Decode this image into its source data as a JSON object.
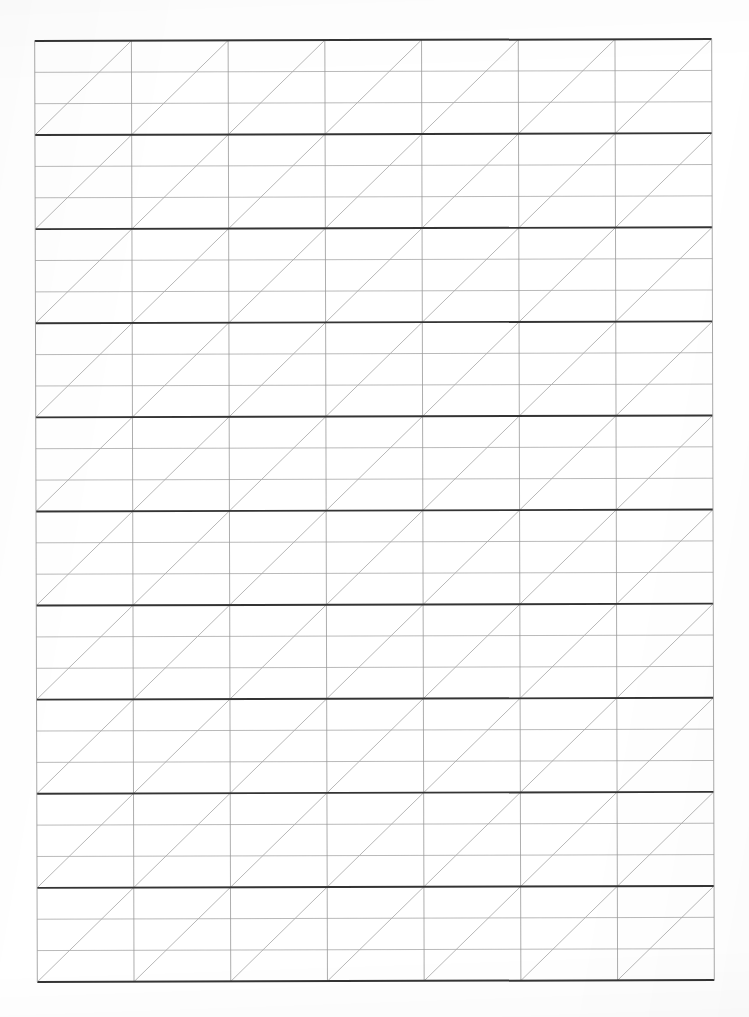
{
  "document": {
    "title": "Ruled Diagonal Grid Worksheet",
    "kind": "scanned-paper-grid",
    "page_width": 749,
    "page_height": 1017,
    "background_color": "#ffffff"
  },
  "grid": {
    "name": "diagonal-ruled-grid",
    "left": 36,
    "top": 40,
    "right": 713,
    "bottom": 981,
    "columns": 7,
    "major_rows": 10,
    "sub_rows_per_major_row": 3,
    "column_width": 96.71,
    "major_row_height": 94.1,
    "sub_row_height": 31.37,
    "skew_degrees": -0.16,
    "colors": {
      "major_horizontal_line": "#343434",
      "minor_horizontal_line": "#a9a9a9",
      "vertical_line": "#9a9a9a",
      "diagonal_line": "#9d9d9d",
      "border": "#343434",
      "paper": "#ffffff"
    },
    "line_widths": {
      "major_horizontal_line": 1.9,
      "minor_horizontal_line": 0.85,
      "vertical_line": 0.85,
      "diagonal_line": 0.8,
      "border_top": 2.0,
      "border_bottom": 2.0,
      "border_left": 0.9,
      "border_right": 0.9
    },
    "diagonal": {
      "direction": "bottom-left-to-top-right",
      "per_cell": 1,
      "description": "Each cell is bisected by a single diagonal rising left-to-right, forming continuous staircase lines across the sheet."
    }
  },
  "chart_data": {
    "type": "table",
    "xlabel": "",
    "ylabel": "",
    "columns": 7,
    "rows": 10,
    "sub_rows_per_row": 3,
    "cells_total": 70,
    "categories": [
      "C1",
      "C2",
      "C3",
      "C4",
      "C5",
      "C6",
      "C7"
    ],
    "values": [
      0,
      0,
      0,
      0,
      0,
      0,
      0
    ],
    "legend": [],
    "annotations": [],
    "grid": true
  }
}
